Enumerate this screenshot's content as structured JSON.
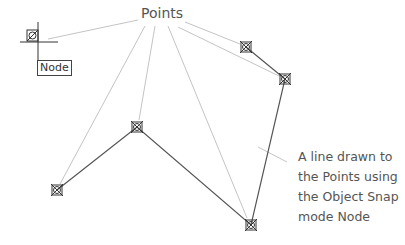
{
  "labels": {
    "points": "Points",
    "tooltip": "Node",
    "description_lines": [
      "A line drawn to",
      "the Points using",
      "the Object Snap",
      "mode Node"
    ]
  },
  "points": [
    {
      "id": "p1",
      "x": 57,
      "y": 190
    },
    {
      "id": "p2",
      "x": 137,
      "y": 127
    },
    {
      "id": "p3",
      "x": 251,
      "y": 225
    },
    {
      "id": "p4",
      "x": 285,
      "y": 79
    },
    {
      "id": "p5",
      "x": 246,
      "y": 47
    }
  ],
  "cursor": {
    "x": 33,
    "y": 36
  },
  "colors": {
    "line": "#555555",
    "leader": "#bbbbbb",
    "text": "#555555"
  }
}
